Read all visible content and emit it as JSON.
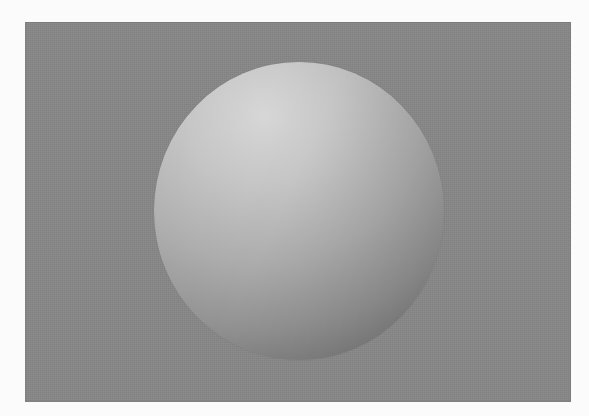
{
  "scene": {
    "description": "Grayscale rendered sphere on a flat mid-gray background",
    "background": {
      "color": "#878787",
      "bounds": {
        "x": 25,
        "y": 22,
        "width": 546,
        "height": 380
      }
    },
    "sphere": {
      "center": {
        "x": 299,
        "y": 211
      },
      "radius_x": 145,
      "radius_y": 149,
      "highlight_color": "#d6d6d6",
      "shadow_color": "#5c5c5c",
      "light_direction": "top-left"
    },
    "page_background": "#fbfbfb"
  }
}
